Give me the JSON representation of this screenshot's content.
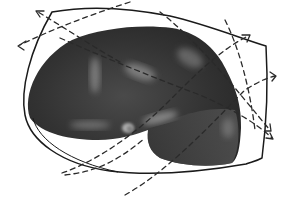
{
  "figure": {
    "colors": {
      "background": "#ffffff",
      "shape_dark": "#2e2e2e",
      "shape_mid": "#555555",
      "highlight": "#9a9a9a",
      "ink": "#1a1a1a"
    },
    "elements": {
      "shape": "dark-gray-3d-blob",
      "boundary": "hand-drawn-outline",
      "arrows": [
        {
          "name": "arrow-top-left-upper",
          "direction": "up-left"
        },
        {
          "name": "arrow-top-left-lower",
          "direction": "left"
        },
        {
          "name": "arrow-right-upper",
          "direction": "up-right"
        },
        {
          "name": "arrow-right-middle",
          "direction": "right"
        },
        {
          "name": "arrow-right-lower",
          "direction": "down-right"
        },
        {
          "name": "arrow-right-lowest",
          "direction": "down-right"
        }
      ]
    }
  }
}
